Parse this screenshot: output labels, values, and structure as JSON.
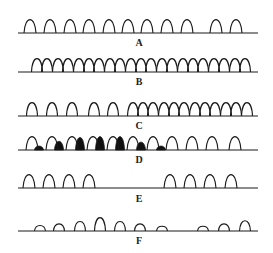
{
  "colors": {
    "stroke": "#1a1a1a",
    "fill_dark": "#111111",
    "background": "#ffffff"
  },
  "rows": [
    {
      "label": "A",
      "baseline_y": 33,
      "line_x": [
        18,
        258
      ],
      "label_y": 37,
      "peaks": [
        {
          "x": 30,
          "h": 17,
          "w": 12
        },
        {
          "x": 50,
          "h": 17,
          "w": 12
        },
        {
          "x": 70,
          "h": 17,
          "w": 12
        },
        {
          "x": 89,
          "h": 17,
          "w": 12
        },
        {
          "x": 109,
          "h": 17,
          "w": 12
        },
        {
          "x": 128,
          "h": 17,
          "w": 12
        },
        {
          "x": 147,
          "h": 17,
          "w": 12
        },
        {
          "x": 167,
          "h": 17,
          "w": 12
        },
        {
          "x": 187,
          "h": 17,
          "w": 12
        },
        {
          "x": 216,
          "h": 17,
          "w": 12
        },
        {
          "x": 236,
          "h": 17,
          "w": 12
        }
      ]
    },
    {
      "label": "B",
      "baseline_y": 72,
      "line_x": [
        18,
        258
      ],
      "label_y": 76,
      "peaks": [
        {
          "x": 37,
          "h": 17,
          "w": 11
        },
        {
          "x": 47,
          "h": 17,
          "w": 11
        },
        {
          "x": 58,
          "h": 17,
          "w": 11
        },
        {
          "x": 68,
          "h": 17,
          "w": 11
        },
        {
          "x": 79,
          "h": 17,
          "w": 11
        },
        {
          "x": 89,
          "h": 17,
          "w": 11
        },
        {
          "x": 99,
          "h": 17,
          "w": 11
        },
        {
          "x": 110,
          "h": 17,
          "w": 11
        },
        {
          "x": 120,
          "h": 17,
          "w": 11
        },
        {
          "x": 131,
          "h": 17,
          "w": 11
        },
        {
          "x": 141,
          "h": 17,
          "w": 11
        },
        {
          "x": 151,
          "h": 17,
          "w": 11
        },
        {
          "x": 162,
          "h": 17,
          "w": 11
        },
        {
          "x": 172,
          "h": 17,
          "w": 11
        },
        {
          "x": 183,
          "h": 17,
          "w": 11
        },
        {
          "x": 193,
          "h": 17,
          "w": 11
        },
        {
          "x": 203,
          "h": 17,
          "w": 11
        },
        {
          "x": 214,
          "h": 17,
          "w": 11
        },
        {
          "x": 224,
          "h": 17,
          "w": 11
        },
        {
          "x": 235,
          "h": 17,
          "w": 11
        },
        {
          "x": 245,
          "h": 17,
          "w": 11
        }
      ]
    },
    {
      "label": "C",
      "baseline_y": 116,
      "line_x": [
        18,
        258
      ],
      "label_y": 120,
      "peaks": [
        {
          "x": 32,
          "h": 17,
          "w": 11
        },
        {
          "x": 52,
          "h": 17,
          "w": 11
        },
        {
          "x": 72,
          "h": 17,
          "w": 11
        },
        {
          "x": 94,
          "h": 17,
          "w": 11
        },
        {
          "x": 113,
          "h": 17,
          "w": 11
        },
        {
          "x": 133,
          "h": 17,
          "w": 11
        },
        {
          "x": 143,
          "h": 17,
          "w": 11
        },
        {
          "x": 153,
          "h": 17,
          "w": 11
        },
        {
          "x": 164,
          "h": 17,
          "w": 11
        },
        {
          "x": 174,
          "h": 17,
          "w": 11
        },
        {
          "x": 184,
          "h": 17,
          "w": 11
        },
        {
          "x": 195,
          "h": 17,
          "w": 11
        },
        {
          "x": 205,
          "h": 17,
          "w": 11
        },
        {
          "x": 215,
          "h": 17,
          "w": 11
        },
        {
          "x": 226,
          "h": 17,
          "w": 11
        },
        {
          "x": 236,
          "h": 17,
          "w": 11
        },
        {
          "x": 247,
          "h": 17,
          "w": 11
        }
      ]
    },
    {
      "label": "D",
      "baseline_y": 150,
      "line_x": [
        18,
        258
      ],
      "label_y": 154,
      "peaks": [
        {
          "x": 32,
          "h": 17,
          "w": 12
        },
        {
          "x": 52,
          "h": 17,
          "w": 12
        },
        {
          "x": 72,
          "h": 17,
          "w": 12
        },
        {
          "x": 93,
          "h": 17,
          "w": 12
        },
        {
          "x": 113,
          "h": 17,
          "w": 12
        },
        {
          "x": 133,
          "h": 17,
          "w": 12
        },
        {
          "x": 153,
          "h": 17,
          "w": 12
        },
        {
          "x": 172,
          "h": 17,
          "w": 12
        },
        {
          "x": 192,
          "h": 17,
          "w": 12
        },
        {
          "x": 212,
          "h": 17,
          "w": 12
        },
        {
          "x": 235,
          "h": 17,
          "w": 12
        }
      ],
      "filled_peaks": [
        {
          "x": 39,
          "h": 5,
          "w": 9
        },
        {
          "x": 59,
          "h": 11,
          "w": 9
        },
        {
          "x": 80,
          "h": 16,
          "w": 9
        },
        {
          "x": 100,
          "h": 17,
          "w": 9
        },
        {
          "x": 120,
          "h": 17,
          "w": 9
        },
        {
          "x": 141,
          "h": 10,
          "w": 9
        },
        {
          "x": 161,
          "h": 5,
          "w": 9
        }
      ]
    },
    {
      "label": "E",
      "baseline_y": 188,
      "line_x": [
        18,
        258
      ],
      "label_y": 193,
      "peaks": [
        {
          "x": 29,
          "h": 17,
          "w": 12
        },
        {
          "x": 49,
          "h": 17,
          "w": 12
        },
        {
          "x": 69,
          "h": 17,
          "w": 12
        },
        {
          "x": 89,
          "h": 17,
          "w": 12
        },
        {
          "x": 170,
          "h": 17,
          "w": 12
        },
        {
          "x": 190,
          "h": 17,
          "w": 12
        },
        {
          "x": 210,
          "h": 17,
          "w": 12
        },
        {
          "x": 231,
          "h": 17,
          "w": 12
        }
      ]
    },
    {
      "label": "F",
      "baseline_y": 231,
      "line_x": [
        18,
        258
      ],
      "label_y": 235,
      "peaks": [
        {
          "x": 40,
          "h": 7,
          "w": 11
        },
        {
          "x": 59,
          "h": 9,
          "w": 11
        },
        {
          "x": 80,
          "h": 12,
          "w": 11
        },
        {
          "x": 100,
          "h": 17,
          "w": 11
        },
        {
          "x": 120,
          "h": 12,
          "w": 11
        },
        {
          "x": 140,
          "h": 9,
          "w": 11
        },
        {
          "x": 162,
          "h": 6,
          "w": 11
        },
        {
          "x": 203,
          "h": 6,
          "w": 11
        },
        {
          "x": 224,
          "h": 9,
          "w": 11
        },
        {
          "x": 245,
          "h": 13,
          "w": 11
        }
      ]
    }
  ]
}
